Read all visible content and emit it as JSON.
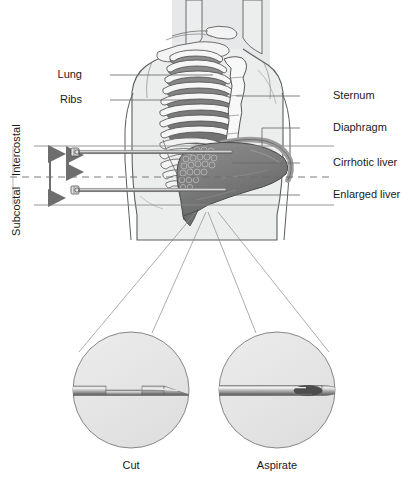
{
  "figure": {
    "width": 410,
    "height": 489
  },
  "colors": {
    "background": "#ffffff",
    "body_fill": "#eceded",
    "body_outline": "#5d5d5d",
    "torso_panel": "#e4e5e6",
    "rib_light": "#f3f3f3",
    "rib_dark": "#6f6f6f",
    "rib_mid": "#9a9a9a",
    "sternum_fill": "#f7f7f7",
    "liver_fill": "#7c7c7c",
    "liver_dark": "#5a5a5a",
    "liver_light": "#9d9d9d",
    "cirrhotic_nodules": "#8a8a8a",
    "diaphragm": "#b4b4b4",
    "needle_shaft": "#8d8d8d",
    "needle_highlight": "#d8d8d8",
    "inset_fill": "#e6e6e6",
    "inset_outline": "#7a7a7a",
    "leader_line": "#6b6b6b",
    "thin_line": "#8c8c8c",
    "dashed_line": "#6b6b6b",
    "arrow": "#6e6e6e",
    "text": "#1a1a1a"
  },
  "labels": {
    "left": [
      {
        "id": "lung",
        "text": "Lung",
        "x": 82,
        "y": 72,
        "leader_from_x": 110,
        "leader_y": 75,
        "leader_to_x": 213
      },
      {
        "id": "ribs",
        "text": "Ribs",
        "x": 84,
        "y": 97,
        "leader_from_x": 110,
        "leader_y": 100,
        "leader_to_x": 196
      }
    ],
    "right": [
      {
        "id": "sternum",
        "text": "Sternum",
        "x": 333,
        "y": 92,
        "leader_from_x": 300,
        "leader_y": 96,
        "leader_to_x": 236
      },
      {
        "id": "diaphragm",
        "text": "Diaphragm",
        "x": 333,
        "y": 124,
        "leader_from_x": 300,
        "leader_y": 128,
        "leader_to_x": 255
      },
      {
        "id": "cirrhotic-liver",
        "text": "Cirrhotic liver",
        "x": 333,
        "y": 159,
        "leader_from_x": 300,
        "leader_y": 163,
        "leader_to_x": 232
      },
      {
        "id": "enlarged-liver",
        "text": "Enlarged liver",
        "x": 333,
        "y": 191,
        "leader_from_x": 300,
        "leader_y": 195,
        "leader_to_x": 226
      }
    ],
    "vertical": [
      {
        "id": "intercostal",
        "text": "Intercostal",
        "x": 22,
        "y": 171
      },
      {
        "id": "subcostal",
        "text": "Subcostal",
        "x": 22,
        "y": 233
      }
    ]
  },
  "insets": [
    {
      "id": "cut",
      "caption": "Cut",
      "cx": 131,
      "cy": 390,
      "r": 58,
      "caption_x": 131,
      "caption_y": 465,
      "needle_type": "cutting-bevel-with-notch"
    },
    {
      "id": "aspirate",
      "caption": "Aspirate",
      "cx": 277,
      "cy": 390,
      "r": 58,
      "caption_x": 277,
      "caption_y": 465,
      "needle_type": "aspiration-bevel"
    }
  ],
  "needles": [
    {
      "id": "intercostal-needle",
      "y": 152,
      "hub_x": 72,
      "tip_x": 232
    },
    {
      "id": "subcostal-needle",
      "y": 190,
      "hub_x": 72,
      "tip_x": 226
    }
  ],
  "guides": {
    "upper_line_y": 146,
    "dashed_line_y": 177,
    "lower_line_y": 205,
    "left_edge_x": 34,
    "right_edge_x": 334
  },
  "arrows": {
    "subcostal_span": {
      "x": 50,
      "y_top": 148,
      "y_bottom": 203
    },
    "intercostal_span": {
      "x": 68,
      "y_top": 150,
      "y_bottom": 175
    }
  },
  "anatomy": [
    {
      "id": "torso",
      "name": "torso-silhouette"
    },
    {
      "id": "lung",
      "name": "lung"
    },
    {
      "id": "ribs",
      "name": "rib-cage"
    },
    {
      "id": "sternum",
      "name": "sternum"
    },
    {
      "id": "clavicle",
      "name": "clavicle"
    },
    {
      "id": "diaphragm",
      "name": "diaphragm"
    },
    {
      "id": "liver",
      "name": "enlarged-cirrhotic-liver"
    }
  ]
}
